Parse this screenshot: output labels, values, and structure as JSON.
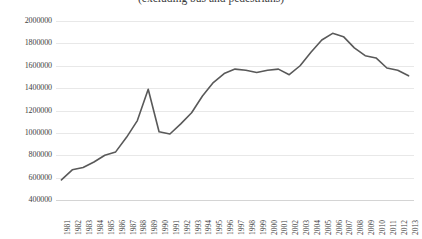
{
  "chart_data": {
    "type": "line",
    "title": "(excluding bus and pedestrians)",
    "xlabel": "",
    "ylabel": "",
    "ylim": [
      400000,
      2000000
    ],
    "ytick_step": 200000,
    "yticks": [
      2000000,
      1800000,
      1600000,
      1400000,
      1200000,
      1000000,
      800000,
      600000,
      400000
    ],
    "ytick_labels": [
      "2000000",
      "1800000",
      "1600000",
      "1400000",
      "1200000",
      "1000000",
      "800000",
      "600000",
      "400000"
    ],
    "grid": true,
    "legend": "none",
    "line_color": "#595959",
    "line_width": 1.6,
    "markers": false,
    "categories": [
      "1981",
      "1982",
      "1983",
      "1984",
      "1985",
      "1986",
      "1987",
      "1988",
      "1989",
      "1990",
      "1991",
      "1992",
      "1993",
      "1994",
      "1995",
      "1996",
      "1997",
      "1998",
      "1999",
      "2000",
      "2001",
      "2002",
      "2003",
      "2004",
      "2005",
      "2006",
      "2007",
      "2008",
      "2009",
      "2010",
      "2011",
      "2012",
      "2013"
    ],
    "values": [
      580000,
      670000,
      690000,
      740000,
      800000,
      830000,
      960000,
      1110000,
      1390000,
      1010000,
      990000,
      1080000,
      1180000,
      1330000,
      1450000,
      1530000,
      1570000,
      1560000,
      1540000,
      1560000,
      1570000,
      1520000,
      1600000,
      1720000,
      1830000,
      1890000,
      1860000,
      1760000,
      1690000,
      1670000,
      1580000,
      1560000,
      1510000
    ],
    "series": [
      {
        "name": "total",
        "values": [
          580000,
          670000,
          690000,
          740000,
          800000,
          830000,
          960000,
          1110000,
          1390000,
          1010000,
          990000,
          1080000,
          1180000,
          1330000,
          1450000,
          1530000,
          1570000,
          1560000,
          1540000,
          1560000,
          1570000,
          1520000,
          1600000,
          1720000,
          1830000,
          1890000,
          1860000,
          1760000,
          1690000,
          1670000,
          1580000,
          1560000,
          1510000
        ]
      }
    ],
    "annotations": []
  }
}
